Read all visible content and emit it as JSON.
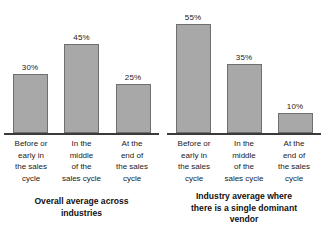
{
  "chart_data": [
    {
      "type": "bar",
      "title": "Overall average across industries",
      "caption_lines": [
        "Overall average across",
        "industries"
      ],
      "xlabel": "",
      "ylabel": "",
      "ylim": [
        0,
        60
      ],
      "grid": false,
      "legend": "none",
      "categories": [
        "Before or early in the sales cycle",
        "In the middle of the sales cycle",
        "At the end of the sales cycle"
      ],
      "category_lines": [
        [
          "Before or",
          "early in",
          "the sales",
          "cycle"
        ],
        [
          "In the",
          "middle",
          "of the",
          "sales cycle"
        ],
        [
          "At the",
          "end of",
          "the sales",
          "cycle"
        ]
      ],
      "values": [
        30,
        45,
        25
      ],
      "value_labels": [
        "30%",
        "45%",
        "25%"
      ]
    },
    {
      "type": "bar",
      "title": "Industry average where there is a single dominant vendor",
      "caption_lines": [
        "Industry average where",
        "there is a single dominant",
        "vendor"
      ],
      "xlabel": "",
      "ylabel": "",
      "ylim": [
        0,
        60
      ],
      "grid": false,
      "legend": "none",
      "categories": [
        "Before or early in the sales cycle",
        "In the middle of the sales cycle",
        "At the end of the sales cycle"
      ],
      "category_lines": [
        [
          "Before or",
          "early in",
          "the sales",
          "cycle"
        ],
        [
          "In the",
          "middle",
          "of the",
          "sales cycle"
        ],
        [
          "At the",
          "end of",
          "the sales",
          "cycle"
        ]
      ],
      "values": [
        55,
        35,
        10
      ],
      "value_labels": [
        "55%",
        "35%",
        "10%"
      ]
    }
  ],
  "style": {
    "bar_fill": "#a8a8a8",
    "bar_stroke": "#6f6f6f",
    "axis_color": "#3a3a3a",
    "text_color": "#1a1a1a",
    "background": "#ffffff",
    "px_per_percent": 1.98
  }
}
